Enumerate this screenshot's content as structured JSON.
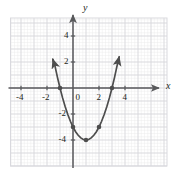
{
  "figure": {
    "axis_labels": {
      "x": "x",
      "y": "y"
    },
    "x_tick_labels": [
      "-4",
      "-2",
      "0",
      "2",
      "4"
    ],
    "y_tick_labels": [
      "4",
      "2",
      "-2",
      "-4"
    ],
    "colors": {
      "curve": "#4d4d4d",
      "axis": "#58595b",
      "grid_major": "#d9d9de",
      "grid_minor": "#ececed",
      "text": "#231f20",
      "background": "#ffffff"
    }
  },
  "chart_data": {
    "type": "line",
    "title": "",
    "xlabel": "x",
    "ylabel": "y",
    "xlim": [
      -5.1,
      5.1
    ],
    "ylim": [
      -5.6,
      5.6
    ],
    "grid": true,
    "grid_major_step": 1,
    "grid_minor_step": 0.25,
    "legend": "none",
    "xticks": [
      -4,
      -2,
      0,
      2,
      4
    ],
    "yticks": [
      4,
      2,
      -2,
      -4
    ],
    "equation": "y = x^2 - 2x - 3",
    "series": [
      {
        "name": "y = x^2 - 2x - 3",
        "x": [
          -1.55,
          -1.4,
          -1.2,
          -1.0,
          -0.8,
          -0.6,
          -0.4,
          -0.2,
          0.0,
          0.2,
          0.4,
          0.6,
          0.8,
          1.0,
          1.2,
          1.4,
          1.6,
          1.8,
          2.0,
          2.2,
          2.4,
          2.6,
          2.8,
          3.0,
          3.2,
          3.4,
          3.55
        ],
        "y": [
          2.2,
          1.76,
          0.84,
          0.0,
          -0.76,
          -1.44,
          -2.04,
          -2.56,
          -3.0,
          -3.36,
          -3.64,
          -3.84,
          -3.96,
          -4.0,
          -3.96,
          -3.84,
          -3.64,
          -3.36,
          -3.0,
          -2.56,
          -2.04,
          -1.44,
          -0.76,
          0.0,
          0.84,
          1.76,
          2.4
        ]
      }
    ],
    "marked_points": [
      {
        "label": "x-intercept",
        "x": -1,
        "y": 0
      },
      {
        "label": "y-intercept",
        "x": 0,
        "y": -3
      },
      {
        "label": "vertex",
        "x": 1,
        "y": -4
      },
      {
        "label": "point",
        "x": 2,
        "y": -3
      },
      {
        "label": "x-intercept",
        "x": 3,
        "y": 0
      }
    ],
    "arrows": [
      "left-branch-up",
      "right-branch-up",
      "x-axis-right",
      "y-axis-up"
    ]
  }
}
